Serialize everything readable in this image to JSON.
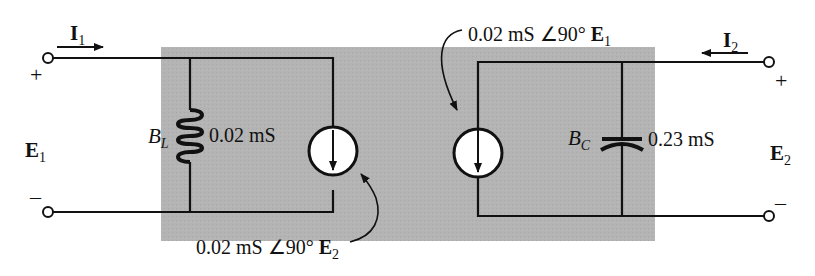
{
  "diagram": {
    "type": "two-port network equivalent circuit",
    "colors": {
      "box_fill": "#b4b4b4",
      "wire": "#111111",
      "background": "#ffffff"
    },
    "port1": {
      "current_label": "I",
      "current_sub": "1",
      "voltage_label": "E",
      "voltage_sub": "1",
      "plus": "+",
      "minus": "–"
    },
    "port2": {
      "current_label": "I",
      "current_sub": "2",
      "voltage_label": "E",
      "voltage_sub": "2",
      "plus": "+",
      "minus": "–"
    },
    "inductor": {
      "symbol": "B",
      "sub": "L",
      "value": "0.02 mS"
    },
    "capacitor": {
      "symbol": "B",
      "sub": "C",
      "value": "0.23 mS"
    },
    "source_left": {
      "label_prefix": "0.02 mS ∠90° ",
      "ref": "E",
      "ref_sub": "2"
    },
    "source_right": {
      "label_prefix": "0.02 mS ∠90° ",
      "ref": "E",
      "ref_sub": "1"
    }
  }
}
